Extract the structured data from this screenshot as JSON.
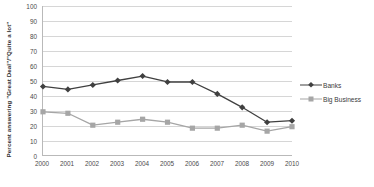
{
  "chart_data": {
    "type": "line",
    "title": "",
    "xlabel": "",
    "ylabel": "Percent answering \"Great Deal\"/\"Quite a lot\"",
    "categories": [
      "2000",
      "2001",
      "2002",
      "2003",
      "2004",
      "2005",
      "2006",
      "2007",
      "2008",
      "2009",
      "2010"
    ],
    "ylim": [
      0,
      100
    ],
    "yticks": [
      "0",
      "10",
      "20",
      "30",
      "40",
      "50",
      "60",
      "70",
      "80",
      "90",
      "100"
    ],
    "grid": true,
    "legend_position": "right",
    "series": [
      {
        "name": "Banks",
        "color": "#404040",
        "marker": "diamond",
        "values": [
          46,
          44,
          47,
          50,
          53,
          49,
          49,
          41,
          32,
          22,
          23
        ]
      },
      {
        "name": "Big Business",
        "color": "#a6a6a6",
        "marker": "square",
        "values": [
          29,
          28,
          20,
          22,
          24,
          22,
          18,
          18,
          20,
          16,
          19
        ]
      }
    ]
  },
  "legend": {
    "items": [
      {
        "label": "Banks"
      },
      {
        "label": "Big Business"
      }
    ]
  },
  "colors": {
    "banks": "#404040",
    "big_business": "#a6a6a6",
    "gridline": "#d6d6d6",
    "axis": "#b9b9b9",
    "text": "#3b3b3b"
  }
}
